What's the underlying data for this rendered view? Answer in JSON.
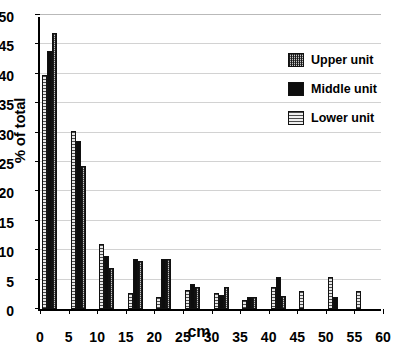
{
  "chart_data": {
    "type": "bar",
    "title": "",
    "subtitle": "",
    "xlabel": "cm",
    "ylabel": "% of total",
    "categories": [
      "0",
      "5",
      "10",
      "15",
      "20",
      "25",
      "30",
      "35",
      "40",
      "45",
      "50",
      "55"
    ],
    "xlim": [
      0,
      60
    ],
    "ylim": [
      0,
      50
    ],
    "ytick_labels": [
      "0",
      "5",
      "10",
      "15",
      "20",
      "25",
      "30",
      "35",
      "40",
      "45",
      "50"
    ],
    "ytick_values": [
      0,
      5,
      10,
      15,
      20,
      25,
      30,
      35,
      40,
      45,
      50
    ],
    "xtick_labels": [
      "0",
      "5",
      "10",
      "15",
      "20",
      "25",
      "30",
      "35",
      "40",
      "45",
      "50",
      "55",
      "60"
    ],
    "xtick_values": [
      0,
      5,
      10,
      15,
      20,
      25,
      30,
      35,
      40,
      45,
      50,
      55,
      60
    ],
    "grid": true,
    "grid_axis": "y",
    "legend_position": "upper-right",
    "bar_order": [
      "Lower unit",
      "Middle unit",
      "Upper unit"
    ],
    "series": [
      {
        "name": "Lower unit",
        "pattern": "horizontal-lines",
        "color": "#d9d9d9",
        "values": [
          39.8,
          30.2,
          11.0,
          2.8,
          2.0,
          3.2,
          2.8,
          1.5,
          3.7,
          3.0,
          5.5,
          3.0
        ]
      },
      {
        "name": "Middle unit",
        "pattern": "solid-black",
        "color": "#0d0d0d",
        "values": [
          43.8,
          28.5,
          9.0,
          8.5,
          8.5,
          4.2,
          2.3,
          2.0,
          5.5,
          0.0,
          2.0,
          0.0
        ]
      },
      {
        "name": "Upper unit",
        "pattern": "crosshatch-grid",
        "color": "#c8c8c8",
        "values": [
          47.0,
          24.3,
          7.0,
          8.2,
          8.5,
          3.7,
          3.8,
          2.1,
          2.2,
          0.0,
          0.0,
          0.0
        ]
      }
    ]
  },
  "legend": {
    "items": [
      {
        "label": "Upper unit",
        "pattern": "crosshatch-grid"
      },
      {
        "label": "Middle unit",
        "pattern": "solid-black"
      },
      {
        "label": "Lower unit",
        "pattern": "horizontal-lines"
      }
    ]
  }
}
